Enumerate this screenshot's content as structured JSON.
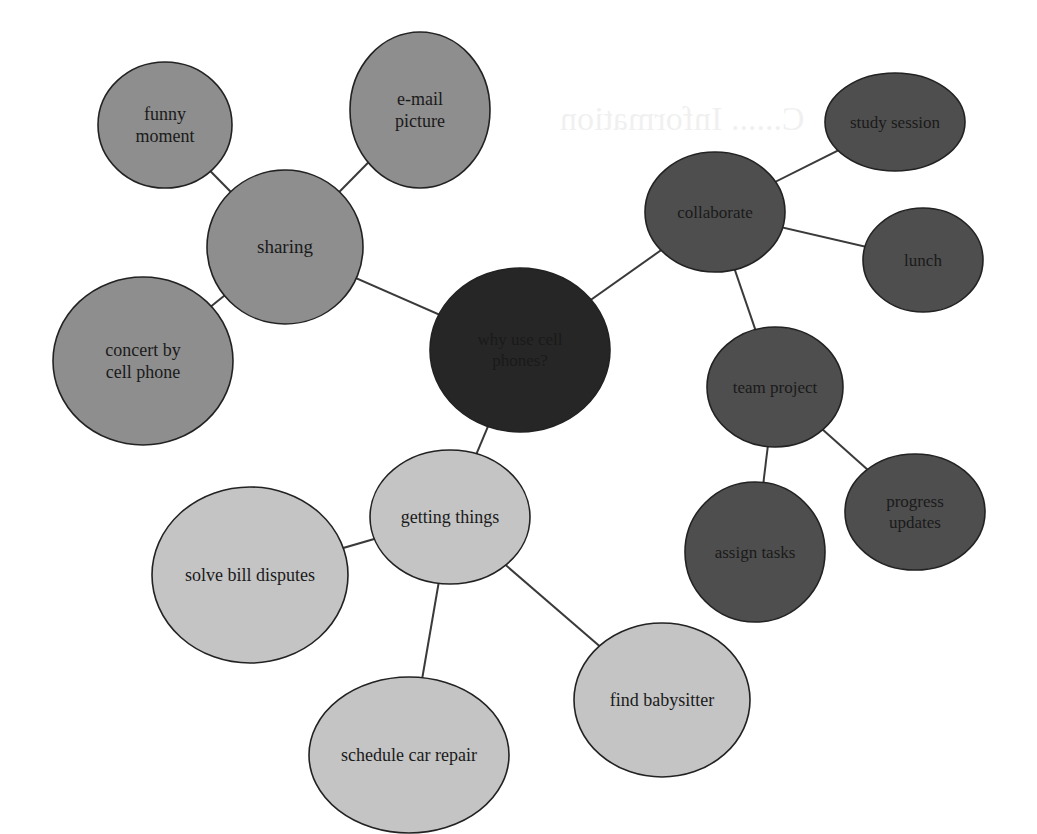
{
  "diagram": {
    "type": "bubble-map",
    "colors": {
      "center": "#262626",
      "sharing_group": "#8e8e8e",
      "collaborate_group": "#4e4e4e",
      "getting_things_group": "#c4c4c4",
      "edge": "#3a3a3a",
      "outline": "#222222"
    },
    "nodes": [
      {
        "id": "center",
        "lines": [
          "why use cell",
          "phones?"
        ],
        "cx": 520,
        "cy": 350,
        "rx": 90,
        "ry": 82,
        "group": "center",
        "font": 17
      },
      {
        "id": "sharing",
        "lines": [
          "sharing"
        ],
        "cx": 285,
        "cy": 247,
        "rx": 78,
        "ry": 77,
        "group": "sharing_group",
        "font": 19
      },
      {
        "id": "funny-moment",
        "lines": [
          "funny",
          "moment"
        ],
        "cx": 165,
        "cy": 125,
        "rx": 67,
        "ry": 63,
        "group": "sharing_group",
        "font": 18
      },
      {
        "id": "e-mail-picture",
        "lines": [
          "e-mail",
          "picture"
        ],
        "cx": 420,
        "cy": 110,
        "rx": 70,
        "ry": 78,
        "group": "sharing_group",
        "font": 18
      },
      {
        "id": "concert-by-cell-phone",
        "lines": [
          "concert by",
          "cell phone"
        ],
        "cx": 143,
        "cy": 361,
        "rx": 90,
        "ry": 84,
        "group": "sharing_group",
        "font": 18
      },
      {
        "id": "collaborate",
        "lines": [
          "collaborate"
        ],
        "cx": 715,
        "cy": 212,
        "rx": 70,
        "ry": 60,
        "group": "collaborate_group",
        "font": 17
      },
      {
        "id": "study-session",
        "lines": [
          "study session"
        ],
        "cx": 895,
        "cy": 122,
        "rx": 70,
        "ry": 49,
        "group": "collaborate_group",
        "font": 17
      },
      {
        "id": "lunch",
        "lines": [
          "lunch"
        ],
        "cx": 923,
        "cy": 260,
        "rx": 60,
        "ry": 52,
        "group": "collaborate_group",
        "font": 17
      },
      {
        "id": "team-project",
        "lines": [
          "team project"
        ],
        "cx": 775,
        "cy": 387,
        "rx": 68,
        "ry": 60,
        "group": "collaborate_group",
        "font": 17
      },
      {
        "id": "assign-tasks",
        "lines": [
          "assign tasks"
        ],
        "cx": 755,
        "cy": 552,
        "rx": 70,
        "ry": 70,
        "group": "collaborate_group",
        "font": 17
      },
      {
        "id": "progress-updates",
        "lines": [
          "progress",
          "updates"
        ],
        "cx": 915,
        "cy": 512,
        "rx": 70,
        "ry": 58,
        "group": "collaborate_group",
        "font": 17
      },
      {
        "id": "getting-things",
        "lines": [
          "getting things"
        ],
        "cx": 450,
        "cy": 517,
        "rx": 80,
        "ry": 67,
        "group": "getting_things_group",
        "font": 18
      },
      {
        "id": "solve-bill-disputes",
        "lines": [
          "solve bill disputes"
        ],
        "cx": 250,
        "cy": 575,
        "rx": 98,
        "ry": 88,
        "group": "getting_things_group",
        "font": 18
      },
      {
        "id": "schedule-car-repair",
        "lines": [
          "schedule car repair"
        ],
        "cx": 409,
        "cy": 755,
        "rx": 100,
        "ry": 78,
        "group": "getting_things_group",
        "font": 18
      },
      {
        "id": "find-babysitter",
        "lines": [
          "find babysitter"
        ],
        "cx": 662,
        "cy": 700,
        "rx": 88,
        "ry": 77,
        "group": "getting_things_group",
        "font": 18
      }
    ],
    "edges": [
      [
        "center",
        "sharing"
      ],
      [
        "center",
        "collaborate"
      ],
      [
        "center",
        "getting-things"
      ],
      [
        "sharing",
        "funny-moment"
      ],
      [
        "sharing",
        "e-mail-picture"
      ],
      [
        "sharing",
        "concert-by-cell-phone"
      ],
      [
        "collaborate",
        "study-session"
      ],
      [
        "collaborate",
        "lunch"
      ],
      [
        "collaborate",
        "team-project"
      ],
      [
        "team-project",
        "assign-tasks"
      ],
      [
        "team-project",
        "progress-updates"
      ],
      [
        "getting-things",
        "solve-bill-disputes"
      ],
      [
        "getting-things",
        "schedule-car-repair"
      ],
      [
        "getting-things",
        "find-babysitter"
      ]
    ]
  },
  "background_bleed_through": {
    "note_visible": "faint mirrored text from reverse side of printed page",
    "fragments": [
      "C...... Information",
      "Strategy ..."
    ]
  }
}
